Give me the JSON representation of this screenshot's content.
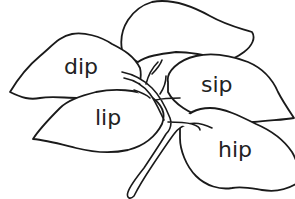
{
  "illustration": {
    "subject": "branch with five leaves",
    "line_color": "#1a1a1a",
    "background": "#ffffff"
  },
  "leaves": [
    {
      "id": "top",
      "word": ""
    },
    {
      "id": "upper-left",
      "word": "dip"
    },
    {
      "id": "right",
      "word": "sip"
    },
    {
      "id": "lower-left",
      "word": "lip"
    },
    {
      "id": "lower-right",
      "word": "hip"
    }
  ]
}
